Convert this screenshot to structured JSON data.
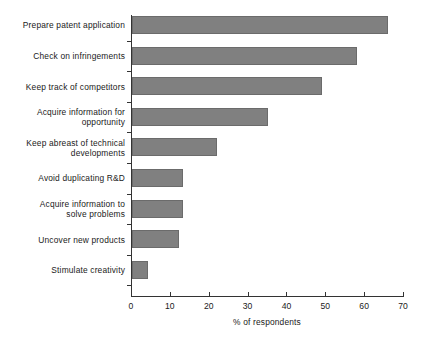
{
  "chart_data": {
    "type": "bar",
    "orientation": "horizontal",
    "title": "",
    "xlabel": "% of respondents",
    "ylabel": "",
    "xlim": [
      0,
      70
    ],
    "xticks": [
      0,
      10,
      20,
      30,
      40,
      50,
      60,
      70
    ],
    "grid": false,
    "legend": null,
    "bar_color": "#808080",
    "bar_edge_color": "#6b6b6b",
    "axis_color": "#333333",
    "categories": [
      "Prepare patent application",
      "Check on infringements",
      "Keep track of competitors",
      "Acquire information for\nopportunity",
      "Keep abreast of technical\ndevelopments",
      "Avoid duplicating R&D",
      "Acquire information to\nsolve problems",
      "Uncover new products",
      "Stimulate creativity"
    ],
    "values": [
      66,
      58,
      49,
      35,
      22,
      13,
      13,
      12,
      4
    ]
  }
}
